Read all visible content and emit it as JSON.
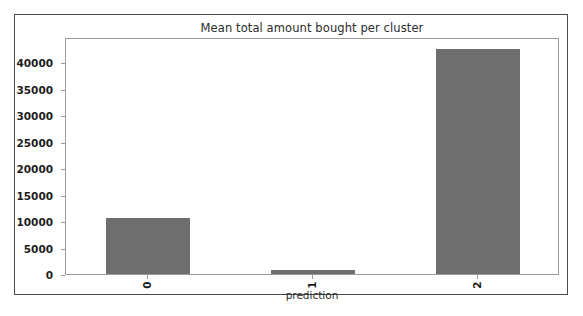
{
  "figure": {
    "background_color": "#ffffff",
    "border_color": "#4a4a4a",
    "axes_color": "#9b9b9b"
  },
  "chart_data": {
    "type": "bar",
    "title": "Mean total amount bought per cluster",
    "xlabel": "prediction",
    "ylabel": "",
    "categories": [
      "0",
      "1",
      "2"
    ],
    "values": [
      10500,
      800,
      42500
    ],
    "series": [
      {
        "name": "mean total amount bought",
        "values": [
          10500,
          800,
          42500
        ]
      }
    ],
    "ylim": [
      0,
      44800
    ],
    "xlim": [
      -0.5,
      2.5
    ],
    "yticks": [
      0,
      5000,
      10000,
      15000,
      20000,
      25000,
      30000,
      35000,
      40000
    ],
    "ytick_labels": [
      "0",
      "5000",
      "10000",
      "15000",
      "20000",
      "25000",
      "30000",
      "35000",
      "40000"
    ],
    "xtick_labels": [
      "0",
      "1",
      "2"
    ],
    "xtick_rotation": 90,
    "grid": false,
    "legend": null,
    "bar_color": "#6e6e6e",
    "bar_width_fraction": 0.51
  }
}
